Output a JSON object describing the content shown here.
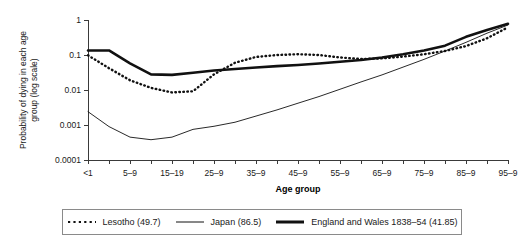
{
  "chart_data": {
    "type": "line",
    "title": "",
    "xlabel": "Age group",
    "ylabel": "Probability of dying in each age group (log scale)",
    "ylabel_line1": "Probability of dying in each age",
    "ylabel_line2": "group (log scale)",
    "log_y": true,
    "ylim": [
      0.0001,
      1
    ],
    "y_ticks": [
      "1",
      "0.1",
      "0.01",
      "0.001",
      "0.0001"
    ],
    "y_tick_values": [
      1,
      0.1,
      0.01,
      0.001,
      0.0001
    ],
    "grid": false,
    "legend_position": "bottom",
    "categories": [
      "<1",
      "1-4",
      "5-9",
      "10-14",
      "15-19",
      "20-24",
      "25-9",
      "30-34",
      "35-9",
      "40-44",
      "45-9",
      "50-54",
      "55-9",
      "60-64",
      "65-9",
      "70-74",
      "75-9",
      "80-84",
      "85-9",
      "90-94",
      "95-9"
    ],
    "x_tick_labels": [
      "<1",
      "",
      "5-9",
      "",
      "15-19",
      "",
      "25-9",
      "",
      "35-9",
      "",
      "45-9",
      "",
      "55-9",
      "",
      "65-9",
      "",
      "75-9",
      "",
      "85-9",
      "",
      "95-9"
    ],
    "series": [
      {
        "name": "Lesotho (49.7)",
        "style": "dotted",
        "values": [
          0.098,
          0.042,
          0.019,
          0.0115,
          0.0085,
          0.0092,
          0.028,
          0.06,
          0.088,
          0.1,
          0.105,
          0.1,
          0.085,
          0.077,
          0.08,
          0.09,
          0.105,
          0.13,
          0.18,
          0.3,
          0.62
        ]
      },
      {
        "name": "Japan (86.5)",
        "style": "thin-solid",
        "values": [
          0.0024,
          0.0009,
          0.00045,
          0.00038,
          0.00045,
          0.00075,
          0.00092,
          0.0012,
          0.0018,
          0.0027,
          0.0042,
          0.0065,
          0.0105,
          0.017,
          0.027,
          0.045,
          0.075,
          0.13,
          0.23,
          0.42,
          0.72
        ]
      },
      {
        "name": "England and Wales 1838-54 (41.85)",
        "style": "thick-solid",
        "values": [
          0.135,
          0.135,
          0.058,
          0.028,
          0.027,
          0.031,
          0.036,
          0.04,
          0.044,
          0.048,
          0.052,
          0.057,
          0.064,
          0.072,
          0.085,
          0.105,
          0.135,
          0.185,
          0.33,
          0.52,
          0.78
        ]
      }
    ]
  },
  "legend": {
    "items": [
      {
        "label": "Lesotho (49.7)",
        "style": "dotted"
      },
      {
        "label": "Japan (86.5)",
        "style": "thin-solid"
      },
      {
        "label": "England and Wales 1838–54 (41.85)",
        "style": "thick-solid"
      }
    ]
  },
  "axes": {
    "x_title": "Age group",
    "y_title_line1": "Probability of dying in each age",
    "y_title_line2": "group (log scale)"
  }
}
